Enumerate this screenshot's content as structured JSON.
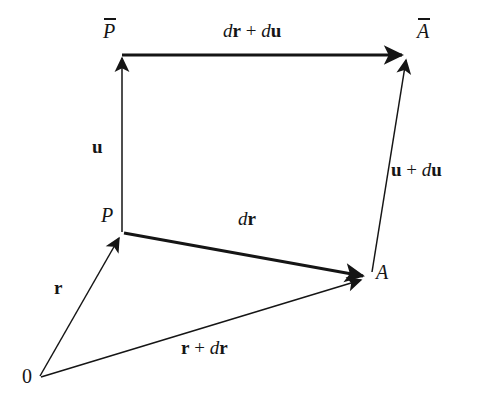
{
  "figure": {
    "background_color": "#ffffff",
    "stroke_color": "#151515",
    "thick_stroke_width": 3.0,
    "thin_stroke_width": 1.5,
    "width": 478,
    "height": 401
  },
  "points": {
    "origin": {
      "label": "0",
      "x": 40,
      "y": 376,
      "label_x": 22,
      "label_y": 366
    },
    "p": {
      "label": "P",
      "x": 122,
      "y": 232,
      "label_x": 101,
      "label_y": 205
    },
    "a": {
      "label": "A",
      "x": 367,
      "y": 277,
      "label_x": 376,
      "label_y": 262
    },
    "p_bar": {
      "label": "P",
      "overline": true,
      "x": 122,
      "y": 55,
      "label_x": 103,
      "label_y": 20
    },
    "a_bar": {
      "label": "A",
      "overline": true,
      "x": 405,
      "y": 55,
      "label_x": 417,
      "label_y": 20
    }
  },
  "vectors": [
    {
      "name": "u",
      "label_parts": [
        {
          "text": "u",
          "style": "bold"
        }
      ],
      "from": "p",
      "to": "p_bar",
      "weight": "thin",
      "label_x": 92,
      "label_y": 137
    },
    {
      "name": "dr-plus-du",
      "label_parts": [
        {
          "text": "d",
          "style": "italic"
        },
        {
          "text": "r",
          "style": "bold"
        },
        {
          "text": " + ",
          "style": "operator"
        },
        {
          "text": "d",
          "style": "italic"
        },
        {
          "text": "u",
          "style": "bold"
        }
      ],
      "from": "p_bar",
      "to": "a_bar",
      "weight": "thick",
      "label_x": 223,
      "label_y": 21
    },
    {
      "name": "u-plus-du",
      "label_parts": [
        {
          "text": "u",
          "style": "bold"
        },
        {
          "text": " + ",
          "style": "operator"
        },
        {
          "text": "d",
          "style": "italic"
        },
        {
          "text": "u",
          "style": "bold"
        }
      ],
      "from": "a",
      "to": "a_bar",
      "weight": "thin",
      "label_x": 391,
      "label_y": 160
    },
    {
      "name": "dr",
      "label_parts": [
        {
          "text": "d",
          "style": "italic"
        },
        {
          "text": "r",
          "style": "bold"
        }
      ],
      "from": "p",
      "to": "a",
      "weight": "thick",
      "label_x": 238,
      "label_y": 209
    },
    {
      "name": "r",
      "label_parts": [
        {
          "text": "r",
          "style": "bold"
        }
      ],
      "from": "origin",
      "to": "p",
      "weight": "thin",
      "label_x": 54,
      "label_y": 278
    },
    {
      "name": "r-plus-dr",
      "label_parts": [
        {
          "text": "r",
          "style": "bold"
        },
        {
          "text": " + ",
          "style": "operator"
        },
        {
          "text": "d",
          "style": "italic"
        },
        {
          "text": "r",
          "style": "bold"
        }
      ],
      "from": "origin",
      "to": "a",
      "weight": "thin",
      "label_x": 181,
      "label_y": 338
    }
  ]
}
